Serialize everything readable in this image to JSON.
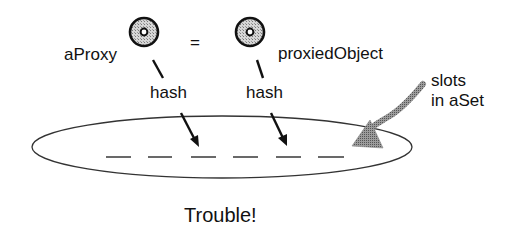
{
  "diagram": {
    "objects": [
      {
        "id": "aProxy",
        "label": "aProxy",
        "icon": "object-circle-icon"
      },
      {
        "id": "proxiedObject",
        "label": "proxiedObject",
        "icon": "object-circle-icon"
      }
    ],
    "equals_sign": "=",
    "hash_labels": [
      "hash",
      "hash"
    ],
    "set_label": {
      "line1": "slots",
      "line2": "in aSet"
    },
    "slot_count": 6,
    "caption": "Trouble!",
    "colors": {
      "ink": "#111111",
      "circle_fill": "#bdbdbd",
      "pointer_arrow": "#8a8a8a",
      "ellipse_stroke": "#333333"
    }
  }
}
